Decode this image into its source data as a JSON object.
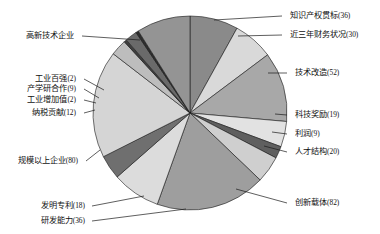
{
  "chart_data": {
    "type": "pie",
    "title": "",
    "subtitle": "",
    "xlabel": "",
    "ylabel": "",
    "legend_position": "callout-labels",
    "grid": false,
    "total": 447,
    "start_angle_deg": -90,
    "direction": "clockwise",
    "categories": [
      "知识产权贯标",
      "近三年财务状况",
      "技术改造",
      "科技奖励",
      "利润",
      "人才结构",
      "创新载体",
      "研发能力",
      "发明专利",
      "规模以上企业",
      "纳税贡献",
      "工业增加值",
      "产学研合作",
      "工业百强",
      "高新技术企业"
    ],
    "values": [
      36,
      30,
      52,
      19,
      9,
      20,
      82,
      36,
      18,
      80,
      12,
      2,
      9,
      2,
      40
    ],
    "labels": [
      "知识产权贯标(36)",
      "近三年财务状况(30)",
      "技术改造(52)",
      "科技奖励(19)",
      "利润(9)",
      "人才结构(20)",
      "创新载体(82)",
      "研发能力(36)",
      "发明专利(18)",
      "规模以上企业(80)",
      "纳税贡献(12)",
      "工业增加值(2)",
      "产学研合作(9)",
      "工业百强(2)",
      "高新技术企业"
    ],
    "colors": [
      "#8a8a8a",
      "#d9d9d9",
      "#a8a8a8",
      "#e2e2e2",
      "#5f5f5f",
      "#cfcfcf",
      "#9e9e9e",
      "#dcdcdc",
      "#6f6f6f",
      "#d5d5d5",
      "#bdbdbd",
      "#3f3f3f",
      "#6a6a6a",
      "#2e2e2e",
      "#949494"
    ]
  },
  "geometry": {
    "center_x": 190,
    "center_y": 113,
    "radius": 97
  },
  "label_layout": [
    {
      "key": "知识产权贯标",
      "text": "知识产权贯标(36)",
      "x": 290,
      "y": 16,
      "anchor": "start",
      "elbow_x": 282,
      "elbow_y": 16,
      "tip_x": 214,
      "tip_y": 20
    },
    {
      "key": "近三年财务状况",
      "text": "近三年财务状况(30)",
      "x": 290,
      "y": 35,
      "anchor": "start",
      "elbow_x": 282,
      "elbow_y": 35,
      "tip_x": 238,
      "tip_y": 36
    },
    {
      "key": "技术改造",
      "text": "技术改造(52)",
      "x": 295,
      "y": 73,
      "anchor": "start",
      "elbow_x": 287,
      "elbow_y": 73,
      "tip_x": 268,
      "tip_y": 73
    },
    {
      "key": "科技奖励",
      "text": "科技奖励(19)",
      "x": 295,
      "y": 115,
      "anchor": "start",
      "elbow_x": 287,
      "elbow_y": 115,
      "tip_x": 275,
      "tip_y": 114
    },
    {
      "key": "利润",
      "text": "利润(9)",
      "x": 295,
      "y": 134,
      "anchor": "start",
      "elbow_x": 287,
      "elbow_y": 134,
      "tip_x": 272,
      "tip_y": 132
    },
    {
      "key": "人才结构",
      "text": "人才结构(20)",
      "x": 295,
      "y": 152,
      "anchor": "start",
      "elbow_x": 287,
      "elbow_y": 152,
      "tip_x": 264,
      "tip_y": 146
    },
    {
      "key": "创新载体",
      "text": "创新载体(82)",
      "x": 295,
      "y": 203,
      "anchor": "start",
      "elbow_x": 287,
      "elbow_y": 203,
      "tip_x": 236,
      "tip_y": 189
    },
    {
      "key": "研发能力",
      "text": "研发能力(36)",
      "x": 85,
      "y": 221,
      "anchor": "end",
      "elbow_x": 92,
      "elbow_y": 221,
      "tip_x": 186,
      "tip_y": 209
    },
    {
      "key": "发明专利",
      "text": "发明专利(18)",
      "x": 85,
      "y": 206,
      "anchor": "end",
      "elbow_x": 92,
      "elbow_y": 206,
      "tip_x": 144,
      "tip_y": 196
    },
    {
      "key": "规模以上企业",
      "text": "规模以上企业(80)",
      "x": 78,
      "y": 161,
      "anchor": "end",
      "elbow_x": 86,
      "elbow_y": 161,
      "tip_x": 100,
      "tip_y": 150
    },
    {
      "key": "纳税贡献",
      "text": "纳税贡献(12)",
      "x": 76,
      "y": 113,
      "anchor": "end",
      "elbow_x": 84,
      "elbow_y": 113,
      "tip_x": 95,
      "tip_y": 110
    },
    {
      "key": "工业增加值",
      "text": "工业增加值(2)",
      "x": 76,
      "y": 100,
      "anchor": "end",
      "elbow_x": 84,
      "elbow_y": 100,
      "tip_x": 96,
      "tip_y": 103
    },
    {
      "key": "产学研合作",
      "text": "产学研合作(9)",
      "x": 76,
      "y": 89,
      "anchor": "end",
      "elbow_x": 84,
      "elbow_y": 89,
      "tip_x": 99,
      "tip_y": 98
    },
    {
      "key": "工业百强",
      "text": "工业百强(2)",
      "x": 76,
      "y": 79,
      "anchor": "end",
      "elbow_x": 84,
      "elbow_y": 79,
      "tip_x": 104,
      "tip_y": 90
    },
    {
      "key": "高新技术企业",
      "text": "高新技术企业",
      "x": 74,
      "y": 36,
      "anchor": "end",
      "elbow_x": 82,
      "elbow_y": 36,
      "tip_x": 140,
      "tip_y": 40
    }
  ]
}
